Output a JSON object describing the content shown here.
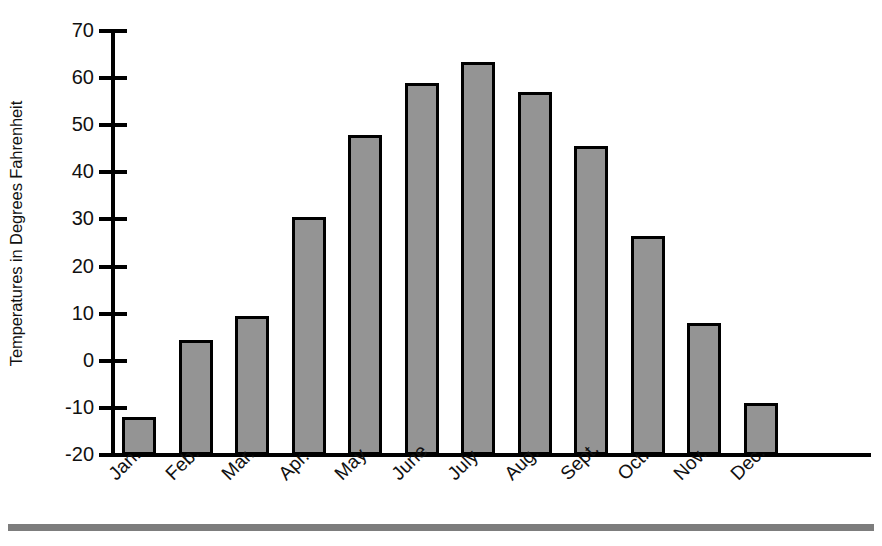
{
  "chart_data": {
    "type": "bar",
    "title": "",
    "subtitle": "",
    "xlabel": "",
    "ylabel": "Temperatures in Degrees Fahrenheit",
    "categories": [
      "Jan.",
      "Feb.",
      "Mar.",
      "Apr.",
      "May",
      "June",
      "July",
      "Aug.",
      "Sept.",
      "Oct.",
      "Nov.",
      "Dec."
    ],
    "values": [
      -12,
      4.5,
      9.5,
      30.5,
      48,
      59,
      63.5,
      57,
      45.5,
      26.5,
      8,
      -9
    ],
    "ylim": [
      -20,
      70
    ],
    "ytick_labels": [
      "70",
      "60",
      "50",
      "40",
      "30",
      "20",
      "10",
      "0",
      "-10",
      "-20"
    ],
    "ytick_values": [
      70,
      60,
      50,
      40,
      30,
      20,
      10,
      0,
      -10,
      -20
    ],
    "ytick_step": 10,
    "grid": false,
    "legend": false,
    "legend_position": "none",
    "bar_fill_color": "#949494",
    "bar_edge_color": "#000000",
    "axis_color": "#000000",
    "text_color": "#111111",
    "background_color": "#ffffff",
    "xlabel_rotation_degrees": -45,
    "bottom_rule_color": "#7d7d7d"
  }
}
